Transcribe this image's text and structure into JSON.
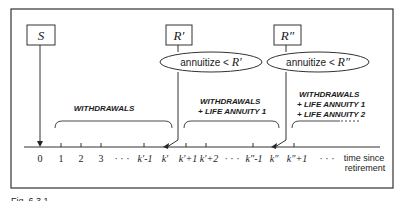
{
  "boxes": {
    "s": {
      "label": "S"
    },
    "r1": {
      "label": "R′"
    },
    "r2": {
      "label": "R″"
    }
  },
  "decisions": {
    "d1": {
      "text": "annuitize < ",
      "var": "R′"
    },
    "d2": {
      "text": "annuitize < ",
      "var": "R″"
    }
  },
  "phases": {
    "p1": {
      "lines": [
        "WITHDRAWALS"
      ]
    },
    "p2": {
      "lines": [
        "WITHDRAWALS",
        "+ LIFE  ANNUITY 1"
      ]
    },
    "p3": {
      "lines": [
        "WITHDRAWALS",
        "+ LIFE  ANNUITY 1",
        "+ LIFE  ANNUITY 2"
      ]
    }
  },
  "axis": {
    "ticks": [
      {
        "label": "0",
        "x": 40
      },
      {
        "label": "1",
        "x": 61
      },
      {
        "label": "2",
        "x": 81
      },
      {
        "label": "3",
        "x": 101
      },
      {
        "label": "k′-1",
        "x": 144
      },
      {
        "label": "k′",
        "x": 165
      },
      {
        "label": "k′+1",
        "x": 186
      },
      {
        "label": "k′+2",
        "x": 206
      },
      {
        "label": "k″-1",
        "x": 253
      },
      {
        "label": "k″",
        "x": 273
      },
      {
        "label": "k″+1",
        "x": 294
      }
    ],
    "ellipses": [
      "· · ·",
      "· · ·",
      "· · ·"
    ],
    "label_line1": "time since",
    "label_line2": "retirement"
  },
  "caption": "Fig. 6.3.1"
}
